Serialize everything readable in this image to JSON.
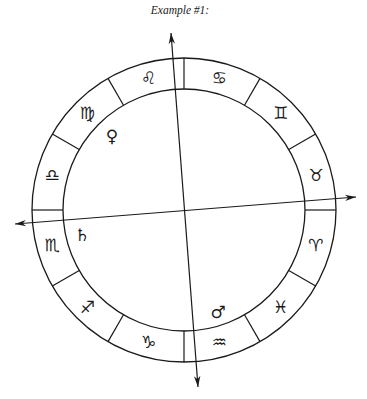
{
  "title": "Example #1:",
  "colors": {
    "line": "#1a1a1a",
    "background": "#ffffff"
  },
  "chart": {
    "center": [
      184,
      210
    ],
    "outer_radius": 152,
    "inner_radius": 121,
    "divider_angles": [
      0,
      30,
      60,
      90,
      120,
      150,
      180,
      210,
      240,
      270,
      300,
      330
    ],
    "signs": [
      {
        "name": "Taurus",
        "glyph": "♉︎",
        "angle": 15
      },
      {
        "name": "Gemini",
        "glyph": "♊︎",
        "angle": 45
      },
      {
        "name": "Cancer",
        "glyph": "♋︎",
        "angle": 75
      },
      {
        "name": "Leo",
        "glyph": "♌︎",
        "angle": 105
      },
      {
        "name": "Virgo",
        "glyph": "♍︎",
        "angle": 135
      },
      {
        "name": "Libra",
        "glyph": "♎︎",
        "angle": 165
      },
      {
        "name": "Scorpio",
        "glyph": "♏︎",
        "angle": 195
      },
      {
        "name": "Sagittarius",
        "glyph": "♐︎",
        "angle": 225
      },
      {
        "name": "Capricorn",
        "glyph": "♑︎",
        "angle": 255
      },
      {
        "name": "Aquarius",
        "glyph": "♒︎",
        "angle": 285
      },
      {
        "name": "Pisces",
        "glyph": "♓︎",
        "angle": 315
      },
      {
        "name": "Aries",
        "glyph": "♈︎",
        "angle": 345
      }
    ],
    "planets": [
      {
        "name": "Venus",
        "glyph": "♀",
        "x": 112,
        "y": 136
      },
      {
        "name": "Saturn",
        "glyph": "♄",
        "x": 82,
        "y": 235
      },
      {
        "name": "Mars",
        "glyph": "♂",
        "x": 218,
        "y": 312
      }
    ],
    "axes": [
      {
        "name": "horizon-axis",
        "from": [
          15,
          224
        ],
        "to": [
          356,
          197
        ]
      },
      {
        "name": "meridian-axis",
        "from": [
          171,
          33
        ],
        "to": [
          198,
          387
        ]
      }
    ]
  }
}
